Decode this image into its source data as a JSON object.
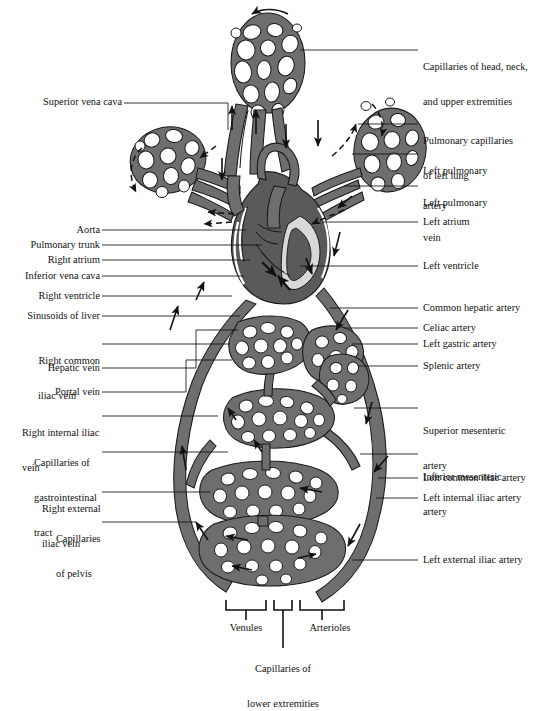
{
  "figure": {
    "colors": {
      "vessel_fill": "#6e6e6e",
      "vessel_outline": "#1a1a1a",
      "heart_fill": "#5a5a5a",
      "background": "#ffffff",
      "text": "#111111",
      "leader": "#111111"
    }
  },
  "labels_left": [
    {
      "id": "superior-vena-cava",
      "text": "Superior vena cava",
      "lines": [
        "Superior vena cava"
      ]
    },
    {
      "id": "aorta",
      "text": "Aorta",
      "lines": [
        "Aorta"
      ]
    },
    {
      "id": "pulmonary-trunk",
      "text": "Pulmonary trunk",
      "lines": [
        "Pulmonary trunk"
      ]
    },
    {
      "id": "right-atrium",
      "text": "Right atrium",
      "lines": [
        "Right atrium"
      ]
    },
    {
      "id": "inferior-vena-cava",
      "text": "Inferior vena cava",
      "lines": [
        "Inferior vena cava"
      ]
    },
    {
      "id": "right-ventricle",
      "text": "Right ventricle",
      "lines": [
        "Right ventricle"
      ]
    },
    {
      "id": "sinusoids-of-liver",
      "text": "Sinusoids of liver",
      "lines": [
        "Sinusoids of liver"
      ]
    },
    {
      "id": "right-common-iliac-vein",
      "text": "Right common iliac vein",
      "lines": [
        "Right common",
        "iliac vein"
      ]
    },
    {
      "id": "hepatic-vein",
      "text": "Hepatic vein",
      "lines": [
        "Hepatic vein"
      ]
    },
    {
      "id": "portal-vein",
      "text": "Portal vein",
      "lines": [
        "Portal vein"
      ]
    },
    {
      "id": "right-internal-iliac-vein",
      "text": "Right internal iliac vein",
      "lines": [
        "Right internal iliac",
        "vein"
      ]
    },
    {
      "id": "capillaries-of-gastrointestinal-tract",
      "text": "Capillaries of gastrointestinal tract",
      "lines": [
        "Capillaries of",
        "gastrointestinal",
        "tract"
      ]
    },
    {
      "id": "right-external-iliac-vein",
      "text": "Right external iliac vein",
      "lines": [
        "Right external",
        "iliac vein"
      ]
    },
    {
      "id": "capillaries-of-pelvis",
      "text": "Capillaries of pelvis",
      "lines": [
        "Capillaries",
        "of pelvis"
      ]
    }
  ],
  "labels_right": [
    {
      "id": "capillaries-of-head-neck-and-upper-extremities",
      "text": "Capillaries of head, neck, and upper extremities",
      "lines": [
        "Capillaries of head, neck,",
        "and upper extremities"
      ]
    },
    {
      "id": "pulmonary-capillaries-of-left-lung",
      "text": "Pulmonary capillaries of left lung",
      "lines": [
        "Pulmonary capillaries",
        "of left lung"
      ]
    },
    {
      "id": "left-pulmonary-artery",
      "text": "Left pulmonary artery",
      "lines": [
        "Left pulmonary",
        "artery"
      ]
    },
    {
      "id": "left-pulmonary-vein",
      "text": "Left pulmonary vein",
      "lines": [
        "Left pulmonary",
        "vein"
      ]
    },
    {
      "id": "left-atrium",
      "text": "Left atrium",
      "lines": [
        "Left atrium"
      ]
    },
    {
      "id": "left-ventricle",
      "text": "Left ventricle",
      "lines": [
        "Left ventricle"
      ]
    },
    {
      "id": "common-hepatic-artery",
      "text": "Common hepatic artery",
      "lines": [
        "Common hepatic artery"
      ]
    },
    {
      "id": "celiac-artery",
      "text": "Celiac artery",
      "lines": [
        "Celiac artery"
      ]
    },
    {
      "id": "left-gastric-artery",
      "text": "Left gastric artery",
      "lines": [
        "Left gastric artery"
      ]
    },
    {
      "id": "splenic-artery",
      "text": "Splenic artery",
      "lines": [
        "Splenic artery"
      ]
    },
    {
      "id": "superior-mesenteric-artery",
      "text": "Superior mesenteric artery",
      "lines": [
        "Superior mesenteric",
        "artery"
      ]
    },
    {
      "id": "inferior-mesenteric-artery",
      "text": "Inferior mesenteric artery",
      "lines": [
        "Inferior mesenteric",
        "artery"
      ]
    },
    {
      "id": "left-common-iliac-artery",
      "text": "Left common iliac artery",
      "lines": [
        "Left common iliac artery"
      ]
    },
    {
      "id": "left-internal-iliac-artery",
      "text": "Left internal iliac artery",
      "lines": [
        "Left internal iliac artery"
      ]
    },
    {
      "id": "left-external-iliac-artery",
      "text": "Left external iliac artery",
      "lines": [
        "Left external iliac artery"
      ]
    }
  ],
  "labels_bottom": [
    {
      "id": "venules",
      "text": "Venules",
      "lines": [
        "Venules"
      ]
    },
    {
      "id": "arterioles",
      "text": "Arterioles",
      "lines": [
        "Arterioles"
      ]
    },
    {
      "id": "capillaries-of-lower-extremities",
      "text": "Capillaries of lower extremities",
      "lines": [
        "Capillaries of",
        "lower extremities"
      ]
    }
  ]
}
